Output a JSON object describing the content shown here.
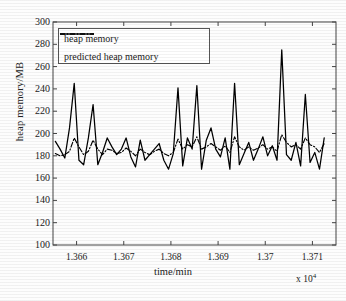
{
  "chart_data": {
    "type": "line",
    "title": "",
    "xlabel": "time/min",
    "ylabel": "heap memory/MB",
    "x_multiplier": "x 10",
    "x_exponent": "4",
    "xlim": [
      1.3655,
      1.3715
    ],
    "ylim": [
      100,
      300
    ],
    "yticks": [
      100,
      120,
      140,
      160,
      180,
      200,
      220,
      240,
      260,
      280,
      300
    ],
    "xticks": [
      "1.366",
      "1.367",
      "1.368",
      "1.369",
      "1.37",
      "1.371"
    ],
    "xtick_values": [
      1.366,
      1.367,
      1.368,
      1.369,
      1.37,
      1.371
    ],
    "grid": false,
    "legend_position": "upper left",
    "series": [
      {
        "name": "heap memory",
        "style": "solid",
        "color": "#000000",
        "x": [
          1.36555,
          1.36565,
          1.36575,
          1.36585,
          1.36595,
          1.36605,
          1.36615,
          1.36625,
          1.36635,
          1.36645,
          1.36655,
          1.36665,
          1.36675,
          1.36685,
          1.36695,
          1.36705,
          1.36715,
          1.36725,
          1.36735,
          1.36745,
          1.36755,
          1.36765,
          1.36775,
          1.36785,
          1.36795,
          1.36805,
          1.36815,
          1.36825,
          1.36835,
          1.36845,
          1.36855,
          1.36865,
          1.36875,
          1.36885,
          1.36895,
          1.36905,
          1.36915,
          1.36925,
          1.36935,
          1.36945,
          1.36955,
          1.36965,
          1.36975,
          1.36985,
          1.36995,
          1.37005,
          1.37015,
          1.37025,
          1.37035,
          1.37045,
          1.37055,
          1.37065,
          1.37075,
          1.37085,
          1.37095,
          1.37105,
          1.37115,
          1.37125
        ],
        "values": [
          193,
          186,
          178,
          205,
          245,
          176,
          172,
          196,
          226,
          172,
          183,
          196,
          188,
          181,
          186,
          196,
          179,
          170,
          194,
          176,
          181,
          186,
          191,
          176,
          168,
          182,
          241,
          171,
          196,
          186,
          243,
          168,
          194,
          205,
          186,
          179,
          196,
          168,
          245,
          172,
          182,
          192,
          176,
          186,
          197,
          180,
          189,
          176,
          275,
          181,
          176,
          192,
          171,
          235,
          174,
          183,
          168,
          196
        ]
      },
      {
        "name": "predicted heap memory",
        "style": "dashdot",
        "color": "#000000",
        "x": [
          1.36555,
          1.36565,
          1.36575,
          1.36585,
          1.36595,
          1.36605,
          1.36615,
          1.36625,
          1.36635,
          1.36645,
          1.36655,
          1.36665,
          1.36675,
          1.36685,
          1.36695,
          1.36705,
          1.36715,
          1.36725,
          1.36735,
          1.36745,
          1.36755,
          1.36765,
          1.36775,
          1.36785,
          1.36795,
          1.36805,
          1.36815,
          1.36825,
          1.36835,
          1.36845,
          1.36855,
          1.36865,
          1.36875,
          1.36885,
          1.36895,
          1.36905,
          1.36915,
          1.36925,
          1.36935,
          1.36945,
          1.36955,
          1.36965,
          1.36975,
          1.36985,
          1.36995,
          1.37005,
          1.37015,
          1.37025,
          1.37035,
          1.37045,
          1.37055,
          1.37065,
          1.37075,
          1.37085,
          1.37095,
          1.37105,
          1.37115,
          1.37125
        ],
        "values": [
          182,
          180,
          181,
          184,
          196,
          188,
          181,
          184,
          194,
          186,
          181,
          186,
          185,
          182,
          183,
          187,
          184,
          180,
          186,
          183,
          181,
          184,
          186,
          182,
          180,
          183,
          195,
          186,
          190,
          188,
          197,
          186,
          188,
          191,
          188,
          185,
          189,
          183,
          197,
          188,
          185,
          188,
          185,
          187,
          190,
          186,
          188,
          184,
          199,
          192,
          188,
          190,
          186,
          196,
          190,
          188,
          183,
          191
        ]
      }
    ]
  },
  "legend": {
    "entries": [
      {
        "label": "heap memory",
        "style": "solid"
      },
      {
        "label": "predicted heap memory",
        "style": "dashdot"
      }
    ]
  }
}
